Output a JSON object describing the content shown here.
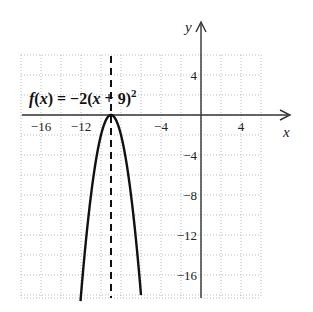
{
  "chart_data": {
    "type": "line",
    "title": "",
    "function_label": "f(x) = −2(x + 9)²",
    "function_label_parts": {
      "name": "f",
      "var": "x",
      "eq": " = −2(",
      "var2": "x",
      "rest": " + 9)",
      "exp": "2"
    },
    "xlabel": "x",
    "ylabel": "y",
    "xlim": [
      -18,
      6
    ],
    "ylim": [
      -18.3,
      6
    ],
    "grid": true,
    "grid_step": 2,
    "x_ticks": [
      -16,
      -12,
      -4,
      4
    ],
    "x_tick_labels": [
      "−16",
      "−12",
      "−4",
      "4"
    ],
    "y_ticks": [
      4,
      -4,
      -8,
      -12,
      -16
    ],
    "y_tick_labels": [
      "4",
      "−4",
      "−8",
      "−12",
      "−16"
    ],
    "vertex": [
      -9,
      0
    ],
    "axis_of_symmetry": {
      "x": -9,
      "style": "dashed"
    },
    "series": [
      {
        "name": "f(x) = -2(x+9)^2",
        "x": [
          -12,
          -11.5,
          -11,
          -10.5,
          -10,
          -9.5,
          -9,
          -8.5,
          -8,
          -7.5,
          -7,
          -6.5,
          -6
        ],
        "y": [
          -18,
          -12.5,
          -8,
          -4.5,
          -2,
          -0.5,
          0,
          -0.5,
          -2,
          -4.5,
          -8,
          -12.5,
          -18
        ]
      }
    ]
  }
}
